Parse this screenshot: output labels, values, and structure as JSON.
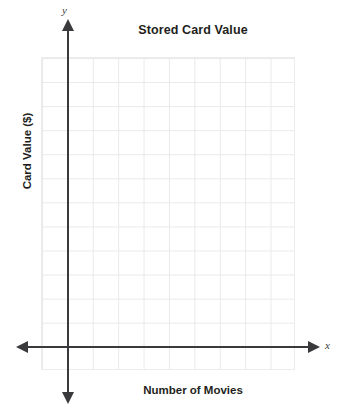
{
  "chart_data": {
    "type": "scatter",
    "title": "Stored Card Value",
    "xlabel": "Number of Movies",
    "ylabel": "Card Value ($)",
    "x": [],
    "y": [],
    "series": [],
    "categories": [],
    "values": [],
    "xlim": [
      0,
      10
    ],
    "ylim": [
      0,
      12
    ],
    "grid": true,
    "legend": false,
    "annotations": [],
    "axis_letters": {
      "x": "x",
      "y": "y"
    },
    "tick_labels": {
      "x": [],
      "y": []
    },
    "grid_columns": 10,
    "grid_rows": 13,
    "colors": {
      "axis": "#3a3a3c",
      "grid": "#e9e9e9",
      "text": "#231f20",
      "background": "#ffffff"
    },
    "note": "Empty blank coordinate grid with arrowed axes; no plotted data points"
  }
}
